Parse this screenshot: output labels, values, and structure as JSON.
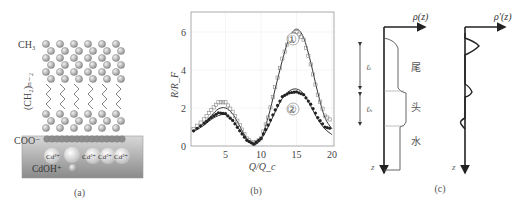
{
  "figure": {
    "panels": [
      {
        "id": "a",
        "caption": "(a)",
        "labels": {
          "ch3": "CH₃",
          "ch2": "(CH₂)ₙ₋₂",
          "coo": "COO⁻",
          "cd_ions": [
            "Cd²⁺",
            "Cd²⁺",
            "Cd²⁺",
            "Cd²⁺"
          ],
          "cdoh": "CdOH⁺"
        }
      },
      {
        "id": "b",
        "caption": "(b)",
        "curve_labels": [
          "①",
          "②"
        ]
      },
      {
        "id": "c",
        "caption": "(c)",
        "left_axis_label": "ρ(z)",
        "right_axis_label": "ρ′(z)",
        "z_label": "z",
        "thickness_labels": [
          "ℓₜ",
          "ℓₕ"
        ],
        "region_labels": [
          "尾",
          "头",
          "水"
        ]
      }
    ]
  },
  "chart_data": {
    "type": "line",
    "title": "",
    "xlabel": "Q/Q_c",
    "ylabel": "R/R_F",
    "xlim": [
      0,
      20
    ],
    "ylim": [
      0,
      6.5
    ],
    "xticks": [
      5,
      10,
      15,
      20
    ],
    "yticks": [
      0,
      2,
      4,
      6
    ],
    "grid": true,
    "x": [
      0.5,
      2,
      3,
      4,
      5,
      6,
      7,
      8,
      9,
      10,
      11,
      12,
      13,
      14,
      15,
      16,
      17,
      18,
      19,
      20
    ],
    "series": [
      {
        "name": "① fit",
        "style": "line",
        "values": [
          0.8,
          1.2,
          1.6,
          1.95,
          2.0,
          1.7,
          1.05,
          0.4,
          0.08,
          0.4,
          1.5,
          3.0,
          4.5,
          5.7,
          6.15,
          5.7,
          4.4,
          2.8,
          1.5,
          0.9
        ]
      },
      {
        "name": "① data",
        "style": "open-squares",
        "values": [
          0.9,
          1.4,
          1.9,
          2.3,
          2.3,
          1.8,
          1.1,
          0.4,
          0.1,
          0.4,
          1.5,
          3.1,
          4.6,
          5.7,
          6.0,
          5.6,
          4.3,
          2.7,
          1.6,
          1.3
        ]
      },
      {
        "name": "② fit",
        "style": "line",
        "values": [
          0.75,
          1.1,
          1.4,
          1.6,
          1.65,
          1.35,
          0.85,
          0.35,
          0.08,
          0.35,
          1.0,
          1.8,
          2.5,
          2.9,
          3.0,
          2.75,
          2.1,
          1.4,
          0.9,
          0.6
        ]
      },
      {
        "name": "② data",
        "style": "filled-markers",
        "values": [
          0.8,
          1.2,
          1.5,
          1.75,
          1.7,
          1.35,
          0.8,
          0.3,
          0.1,
          0.4,
          1.1,
          1.9,
          2.6,
          2.8,
          2.85,
          2.7,
          2.2,
          1.5,
          1.0,
          0.9
        ]
      }
    ],
    "annotations": [
      {
        "text": "①",
        "x": 15,
        "y": 5.1
      },
      {
        "text": "②",
        "x": 15,
        "y": 1.9
      }
    ]
  }
}
